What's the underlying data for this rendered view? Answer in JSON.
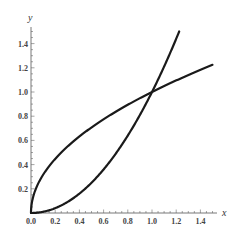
{
  "chart_data": {
    "type": "line",
    "title": "",
    "xlabel": "x",
    "ylabel": "y",
    "xlim": [
      0,
      1.5
    ],
    "ylim": [
      0,
      1.5
    ],
    "grid": false,
    "legend": null,
    "x_ticks": [
      "0.0",
      "0.2",
      "0.4",
      "0.6",
      "0.8",
      "1.0",
      "1.2",
      "1.4"
    ],
    "y_ticks": [
      "0.2",
      "0.4",
      "0.6",
      "0.8",
      "1.0",
      "1.2",
      "1.4"
    ],
    "series": [
      {
        "name": "y = sqrt(x)",
        "color": "#1a1a1a",
        "x": [
          0,
          0.01,
          0.05,
          0.1,
          0.2,
          0.3,
          0.4,
          0.5,
          0.6,
          0.7,
          0.8,
          0.9,
          1.0,
          1.1,
          1.2,
          1.3,
          1.4,
          1.5
        ],
        "y": [
          0,
          0.1,
          0.224,
          0.316,
          0.447,
          0.548,
          0.632,
          0.707,
          0.775,
          0.837,
          0.894,
          0.949,
          1.0,
          1.049,
          1.095,
          1.14,
          1.183,
          1.225
        ]
      },
      {
        "name": "y = x^2",
        "color": "#1a1a1a",
        "x": [
          0,
          0.1,
          0.2,
          0.3,
          0.4,
          0.5,
          0.6,
          0.7,
          0.8,
          0.9,
          1.0,
          1.1,
          1.2,
          1.2247
        ],
        "y": [
          0,
          0.01,
          0.04,
          0.09,
          0.16,
          0.25,
          0.36,
          0.49,
          0.64,
          0.81,
          1.0,
          1.21,
          1.44,
          1.5
        ]
      }
    ],
    "annotations": [
      {
        "label": "intersection",
        "x": 1.0,
        "y": 1.0
      }
    ]
  }
}
